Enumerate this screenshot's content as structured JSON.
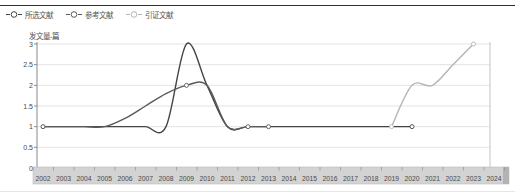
{
  "legend": {
    "items": [
      {
        "id": "selected",
        "label": "所选文献",
        "color": "#454545"
      },
      {
        "id": "references",
        "label": "参考文献",
        "color": "#5a5a5a"
      },
      {
        "id": "citations",
        "label": "引证文献",
        "color": "#b5b5b5"
      }
    ]
  },
  "chart_data": {
    "type": "line",
    "title": "",
    "ylabel": "发文量-篇",
    "xlabel": "",
    "grid": true,
    "legend_position": "top-left",
    "ylim": [
      0,
      3
    ],
    "yticks": [
      "0",
      "0.5",
      "1",
      "1.5",
      "2",
      "2.5",
      "3"
    ],
    "ytick_values": [
      0,
      0.5,
      1,
      1.5,
      2,
      2.5,
      3
    ],
    "x_years": [
      2002,
      2003,
      2004,
      2005,
      2006,
      2007,
      2008,
      2009,
      2010,
      2011,
      2012,
      2013,
      2014,
      2015,
      2016,
      2017,
      2018,
      2019,
      2020,
      2021,
      2022,
      2023,
      2024
    ],
    "series": [
      {
        "id": "selected",
        "name": "所选文献",
        "color": "#454545",
        "points": [
          [
            2002,
            1
          ],
          [
            2003,
            1
          ],
          [
            2004,
            1
          ],
          [
            2005,
            1
          ],
          [
            2006,
            1
          ],
          [
            2007,
            1
          ],
          [
            2008,
            1
          ],
          [
            2009,
            3
          ],
          [
            2010,
            2
          ],
          [
            2011,
            1
          ],
          [
            2012,
            1
          ],
          [
            2013,
            1
          ],
          [
            2014,
            1
          ],
          [
            2015,
            1
          ],
          [
            2016,
            1
          ],
          [
            2017,
            1
          ],
          [
            2018,
            1
          ],
          [
            2019,
            1
          ],
          [
            2020,
            1
          ]
        ]
      },
      {
        "id": "references",
        "name": "参考文献",
        "color": "#5a5a5a",
        "points": [
          [
            2002,
            1
          ],
          [
            2003,
            1
          ],
          [
            2004,
            1
          ],
          [
            2005,
            1
          ],
          [
            2006,
            1.2
          ],
          [
            2007,
            1.5
          ],
          [
            2008,
            1.8
          ],
          [
            2009,
            2
          ],
          [
            2010,
            2
          ],
          [
            2011,
            1
          ],
          [
            2012,
            1
          ],
          [
            2013,
            1
          ]
        ]
      },
      {
        "id": "citations",
        "name": "引证文献",
        "color": "#b5b5b5",
        "points": [
          [
            2019,
            1
          ],
          [
            2020,
            2
          ],
          [
            2021,
            2
          ],
          [
            2022,
            2.5
          ],
          [
            2023,
            3
          ]
        ]
      }
    ],
    "markers": [
      {
        "series": "selected",
        "year": 2002,
        "value": 1
      },
      {
        "series": "references",
        "year": 2009,
        "value": 2
      },
      {
        "series": "references",
        "year": 2012,
        "value": 1
      },
      {
        "series": "references",
        "year": 2013,
        "value": 1
      },
      {
        "series": "selected",
        "year": 2020,
        "value": 1
      },
      {
        "series": "citations",
        "year": 2019,
        "value": 1
      },
      {
        "series": "citations",
        "year": 2023,
        "value": 3
      }
    ],
    "colors": {
      "grid": "#e3e3e3",
      "axis": "#8a8a8a",
      "plot_border": "#c4c4c4",
      "band_fill": "#d3d3d3",
      "band_border": "#bdbdbd",
      "band_cap": "#b3b3b3",
      "tick_text": "#4a4a4a"
    }
  }
}
